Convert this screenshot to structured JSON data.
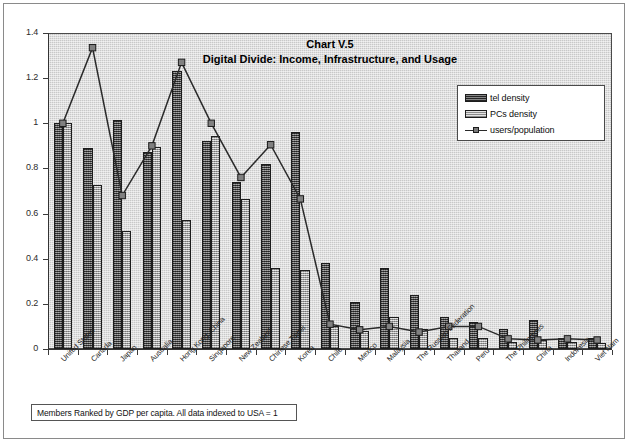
{
  "chart_data": {
    "type": "bar",
    "title": "Chart V.5",
    "subtitle": "Digital Divide: Income, Infrastructure, and Usage",
    "xlabel": "",
    "ylabel": "",
    "ylim": [
      0,
      1.4
    ],
    "ytick_values": [
      0,
      0.2,
      0.4,
      0.6,
      0.8,
      1.0,
      1.2,
      1.4
    ],
    "ytick_labels": [
      "0",
      "0.2",
      "0.4",
      "0.6",
      "0.8",
      "1",
      "1.2",
      "1.4"
    ],
    "grid": false,
    "legend_position": "upper-right-inside",
    "categories": [
      "United States",
      "Canada",
      "Japan",
      "Australia",
      "Hong Kong, China",
      "Singapore",
      "New Zealand",
      "Chinese Taipei",
      "Korea",
      "Chile",
      "Mexico",
      "Malaysia",
      "The Russian Federation",
      "Thailand",
      "Peru",
      "The Philippines",
      "China",
      "Indonesia",
      "Viet Nam"
    ],
    "series": [
      {
        "name": "tel density",
        "kind": "bar",
        "color": "#6f6f6f",
        "values": [
          1.0,
          0.89,
          1.015,
          0.875,
          1.23,
          0.92,
          0.74,
          0.82,
          0.96,
          0.38,
          0.21,
          0.36,
          0.24,
          0.14,
          0.12,
          0.09,
          0.13,
          0.05,
          0.05
        ]
      },
      {
        "name": "PCs density",
        "kind": "bar",
        "color": "#b9b9b9",
        "values": [
          1.0,
          0.725,
          0.525,
          0.895,
          0.57,
          0.945,
          0.665,
          0.36,
          0.35,
          0.1,
          0.08,
          0.14,
          0.09,
          0.05,
          0.05,
          0.03,
          0.04,
          0.03,
          0.025
        ]
      },
      {
        "name": "users/population",
        "kind": "line",
        "color": "#2a2a2a",
        "marker": "square",
        "values": [
          1.0,
          1.335,
          0.68,
          0.9,
          1.27,
          1.0,
          0.76,
          0.905,
          0.665,
          0.11,
          0.085,
          0.1,
          0.075,
          0.1,
          0.1,
          0.045,
          0.04,
          0.045,
          0.04
        ]
      }
    ],
    "footnote": "Members Ranked by GDP per capita. All data indexed to USA = 1"
  },
  "legend": {
    "items": [
      {
        "label": "tel density",
        "swatch": "tel"
      },
      {
        "label": "PCs density",
        "swatch": "pcs"
      },
      {
        "label": "users/population",
        "swatch": "line"
      }
    ]
  }
}
